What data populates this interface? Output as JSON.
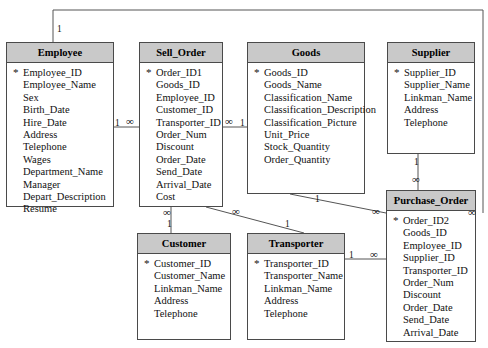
{
  "diagram": {
    "type": "entity-relationship",
    "colors": {
      "header_fill": "#c9c9c9",
      "body_fill": "#ffffff",
      "border": "#4a4a4a",
      "line": "#555555",
      "text": "#111111"
    },
    "pk_marker": "*",
    "cardinality_one": "1",
    "cardinality_many": "∞"
  },
  "entities": [
    {
      "id": "employee",
      "name": "Employee",
      "x": 6,
      "y": 42,
      "w": 108,
      "h": 165,
      "attributes": [
        {
          "name": "Employee_ID",
          "pk": true
        },
        {
          "name": "Employee_Name",
          "pk": false
        },
        {
          "name": "Sex",
          "pk": false
        },
        {
          "name": "Birth_Date",
          "pk": false
        },
        {
          "name": "Hire_Date",
          "pk": false
        },
        {
          "name": "Address",
          "pk": false
        },
        {
          "name": "Telephone",
          "pk": false
        },
        {
          "name": "Wages",
          "pk": false
        },
        {
          "name": "Department_Name",
          "pk": false
        },
        {
          "name": "Manager",
          "pk": false
        },
        {
          "name": "Depart_Description",
          "pk": false
        },
        {
          "name": "Resume",
          "pk": false
        }
      ]
    },
    {
      "id": "sell_order",
      "name": "Sell_Order",
      "x": 139,
      "y": 42,
      "w": 84,
      "h": 165,
      "attributes": [
        {
          "name": "Order_ID1",
          "pk": true
        },
        {
          "name": "Goods_ID",
          "pk": false
        },
        {
          "name": "Employee_ID",
          "pk": false
        },
        {
          "name": "Customer_ID",
          "pk": false
        },
        {
          "name": "Transporter_ID",
          "pk": false
        },
        {
          "name": "Order_Num",
          "pk": false
        },
        {
          "name": "Discount",
          "pk": false
        },
        {
          "name": "Order_Date",
          "pk": false
        },
        {
          "name": "Send_Date",
          "pk": false
        },
        {
          "name": "Arrival_Date",
          "pk": false
        },
        {
          "name": "Cost",
          "pk": false
        }
      ]
    },
    {
      "id": "goods",
      "name": "Goods",
      "x": 247,
      "y": 42,
      "w": 118,
      "h": 152,
      "attributes": [
        {
          "name": "Goods_ID",
          "pk": true
        },
        {
          "name": "Goods_Name",
          "pk": false
        },
        {
          "name": "Classification_Name",
          "pk": false
        },
        {
          "name": "Classification_Description",
          "pk": false
        },
        {
          "name": "Classification_Picture",
          "pk": false
        },
        {
          "name": "Unit_Price",
          "pk": false
        },
        {
          "name": "Stock_Quantity",
          "pk": false
        },
        {
          "name": "Order_Quantity",
          "pk": false
        }
      ]
    },
    {
      "id": "supplier",
      "name": "Supplier",
      "x": 387,
      "y": 42,
      "w": 88,
      "h": 112,
      "attributes": [
        {
          "name": "Supplier_ID",
          "pk": true
        },
        {
          "name": "Supplier_Name",
          "pk": false
        },
        {
          "name": "Linkman_Name",
          "pk": false
        },
        {
          "name": "Address",
          "pk": false
        },
        {
          "name": "Telephone",
          "pk": false
        }
      ]
    },
    {
      "id": "purchase_order",
      "name": "Purchase_Order",
      "x": 386,
      "y": 190,
      "w": 90,
      "h": 152,
      "attributes": [
        {
          "name": "Order_ID2",
          "pk": true
        },
        {
          "name": "Goods_ID",
          "pk": false
        },
        {
          "name": "Employee_ID",
          "pk": false
        },
        {
          "name": "Supplier_ID",
          "pk": false
        },
        {
          "name": "Transporter_ID",
          "pk": false
        },
        {
          "name": "Order_Num",
          "pk": false
        },
        {
          "name": "Discount",
          "pk": false
        },
        {
          "name": "Order_Date",
          "pk": false
        },
        {
          "name": "Send_Date",
          "pk": false
        },
        {
          "name": "Arrival_Date",
          "pk": false
        }
      ]
    },
    {
      "id": "customer",
      "name": "Customer",
      "x": 137,
      "y": 233,
      "w": 94,
      "h": 107,
      "attributes": [
        {
          "name": "Customer_ID",
          "pk": true
        },
        {
          "name": "Customer_Name",
          "pk": false
        },
        {
          "name": "Linkman_Name",
          "pk": false
        },
        {
          "name": "Address",
          "pk": false
        },
        {
          "name": "Telephone",
          "pk": false
        }
      ]
    },
    {
      "id": "transporter",
      "name": "Transporter",
      "x": 247,
      "y": 233,
      "w": 98,
      "h": 107,
      "attributes": [
        {
          "name": "Transporter_ID",
          "pk": true
        },
        {
          "name": "Transporter_Name",
          "pk": false
        },
        {
          "name": "Linkman_Name",
          "pk": false
        },
        {
          "name": "Address",
          "pk": false
        },
        {
          "name": "Telephone",
          "pk": false
        }
      ]
    }
  ],
  "relationships": [
    {
      "id": "employee-purchase_order",
      "from": "employee",
      "to": "purchase_order",
      "from_card": "1",
      "to_card": "∞",
      "path": "M 53 42 L 53 10 L 483 10 L 483 213",
      "from_label": {
        "text": "1",
        "x": 57,
        "y": 24
      },
      "to_label": {
        "text": "∞",
        "x": 468,
        "y": 207
      }
    },
    {
      "id": "employee-sell_order",
      "from": "employee",
      "to": "sell_order",
      "from_card": "1",
      "to_card": "∞",
      "path": "M 114 127 L 139 127",
      "from_label": {
        "text": "1",
        "x": 115,
        "y": 118
      },
      "to_label": {
        "text": "∞",
        "x": 126,
        "y": 116
      }
    },
    {
      "id": "sell_order-goods",
      "from": "sell_order",
      "to": "goods",
      "from_card": "∞",
      "to_card": "1",
      "path": "M 223 127 L 247 127",
      "from_label": {
        "text": "∞",
        "x": 225,
        "y": 116
      },
      "to_label": {
        "text": "1",
        "x": 240,
        "y": 118
      }
    },
    {
      "id": "sell_order-customer",
      "from": "sell_order",
      "to": "customer",
      "from_card": "∞",
      "to_card": "1",
      "path": "M 171 207 L 171 233",
      "from_label": {
        "text": "∞",
        "x": 163,
        "y": 207
      },
      "to_label": {
        "text": "1",
        "x": 167,
        "y": 219
      }
    },
    {
      "id": "sell_order-transporter",
      "from": "sell_order",
      "to": "transporter",
      "from_card": "∞",
      "to_card": "1",
      "path": "M 206 207 L 304 233",
      "from_label": {
        "text": "∞",
        "x": 232,
        "y": 206
      },
      "to_label": {
        "text": "1",
        "x": 285,
        "y": 219
      }
    },
    {
      "id": "goods-purchase_order",
      "from": "goods",
      "to": "purchase_order",
      "from_card": "1",
      "to_card": "∞",
      "path": "M 290 194 L 386 213",
      "from_label": {
        "text": "1",
        "x": 315,
        "y": 194
      },
      "to_label": {
        "text": "∞",
        "x": 372,
        "y": 206
      }
    },
    {
      "id": "supplier-purchase_order",
      "from": "supplier",
      "to": "purchase_order",
      "from_card": "1",
      "to_card": "∞",
      "path": "M 418 154 L 418 190",
      "from_label": {
        "text": "1",
        "x": 414,
        "y": 157
      },
      "to_label": {
        "text": "∞",
        "x": 412,
        "y": 174
      }
    },
    {
      "id": "transporter-purchase_order",
      "from": "transporter",
      "to": "purchase_order",
      "from_card": "1",
      "to_card": "∞",
      "path": "M 345 259 L 386 259",
      "from_label": {
        "text": "1",
        "x": 349,
        "y": 250
      },
      "to_label": {
        "text": "∞",
        "x": 370,
        "y": 249
      }
    }
  ]
}
